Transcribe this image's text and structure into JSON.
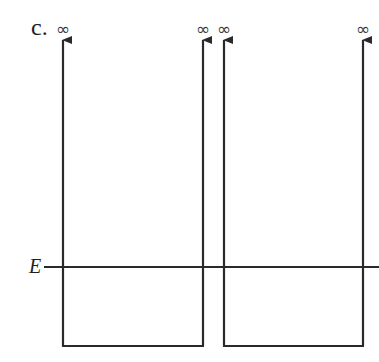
{
  "figure": {
    "part_label": "c.",
    "energy_label": "E",
    "infinity_symbol": "∞",
    "line_color": "#2a2a2a"
  },
  "wells": [
    {
      "name": "left-well",
      "left_wall_x": 63,
      "right_wall_x": 203,
      "floor_y": 346,
      "walls_top": "infinite"
    },
    {
      "name": "right-well",
      "left_wall_x": 224,
      "right_wall_x": 363,
      "floor_y": 346,
      "walls_top": "infinite"
    }
  ],
  "infinity_markers": [
    {
      "x": 63,
      "label": "∞"
    },
    {
      "x": 203,
      "label": "∞"
    },
    {
      "x": 224,
      "label": "∞"
    },
    {
      "x": 363,
      "label": "∞"
    }
  ],
  "energy_level": {
    "label": "E",
    "y": 267,
    "x_start": 44,
    "x_end": 379
  }
}
